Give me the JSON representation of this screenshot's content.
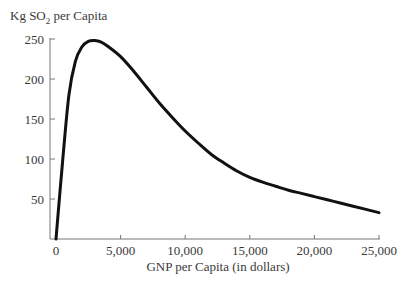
{
  "chart_data": {
    "type": "line",
    "title": "",
    "ylabel": "Kg SO2 per Capita",
    "ylabel_parts": {
      "main": "Kg SO",
      "sub": "2",
      "rest": " per Capita"
    },
    "xlabel": "GNP per Capita (in dollars)",
    "xlim": [
      0,
      25000
    ],
    "ylim": [
      0,
      250
    ],
    "x_ticks": [
      0,
      5000,
      10000,
      15000,
      20000,
      25000
    ],
    "x_tick_labels": [
      "0",
      "5,000",
      "10,000",
      "15,000",
      "20,000",
      "25,000"
    ],
    "y_ticks": [
      50,
      100,
      150,
      200,
      250
    ],
    "y_tick_labels": [
      "50",
      "100",
      "150",
      "200",
      "250"
    ],
    "grid": false,
    "legend": null,
    "series": [
      {
        "name": "SO2 emissions (environmental Kuznets curve)",
        "color": "#111111",
        "x": [
          0,
          500,
          1000,
          1500,
          2000,
          2500,
          3000,
          3500,
          4000,
          5000,
          6000,
          7000,
          8000,
          9000,
          10000,
          11000,
          12000,
          13000,
          14000,
          15000,
          16000,
          17000,
          18000,
          19000,
          20000,
          21000,
          22000,
          23000,
          24000,
          25000
        ],
        "y": [
          0,
          95,
          180,
          222,
          240,
          247,
          248,
          246,
          241,
          228,
          210,
          190,
          170,
          152,
          135,
          120,
          106,
          95,
          85,
          77,
          71,
          66,
          61,
          57,
          53,
          49,
          45,
          41,
          37,
          33
        ]
      }
    ]
  }
}
